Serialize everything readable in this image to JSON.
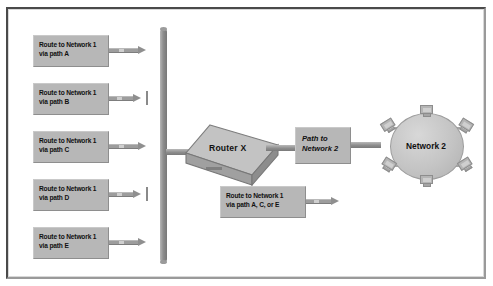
{
  "diagram": {
    "colors": {
      "box_fill": "#b7b7b7",
      "line": "#8f8f8f",
      "backbone": "#8e8e8e",
      "cloud_fill": "#c4c4c4",
      "frame_dark": "#4a4a4a",
      "frame_light": "#9a9a9a",
      "text": "#111111",
      "page_background": "#ffffff"
    },
    "left_routes": [
      {
        "id": "route-a",
        "line1": "Route to Network 1",
        "line2": "via path A",
        "path_letter": "A",
        "blocked": false
      },
      {
        "id": "route-b",
        "line1": "Route to Network 1",
        "line2": "via path B",
        "path_letter": "B",
        "blocked": true
      },
      {
        "id": "route-c",
        "line1": "Route to Network 1",
        "line2": "via path C",
        "path_letter": "C",
        "blocked": false
      },
      {
        "id": "route-d",
        "line1": "Route to Network 1",
        "line2": "via path D",
        "path_letter": "D",
        "blocked": true
      },
      {
        "id": "route-e",
        "line1": "Route to Network 1",
        "line2": "via path E",
        "path_letter": "E",
        "blocked": false
      }
    ],
    "router": {
      "label": "Router X"
    },
    "selected_route": {
      "line1": "Route to Network 1",
      "line2": "via path A, C, or E"
    },
    "path_box": {
      "line1": "Path to",
      "line2": "Network 2"
    },
    "network_cloud": {
      "label": "Network 2",
      "node_count": 6,
      "node_icon": "workstation-icon"
    }
  }
}
